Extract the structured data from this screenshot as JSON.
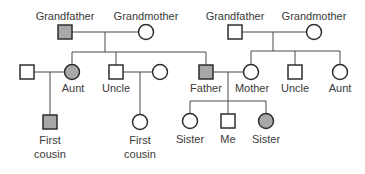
{
  "colors": {
    "line": "#4a4a4a",
    "affected_fill": "#a8a8a8",
    "unaffected_fill": "#ffffff",
    "text": "#3a3a3a"
  },
  "people": [
    {
      "id": "paternal-grandfather",
      "label": "Grandfather",
      "sex": "male",
      "affected": true,
      "cx": 65,
      "cy": 32,
      "label_y": 10
    },
    {
      "id": "paternal-grandmother",
      "label": "Grandmother",
      "sex": "female",
      "affected": false,
      "cx": 146,
      "cy": 32,
      "label_y": 10
    },
    {
      "id": "aunt-husband",
      "label": "",
      "sex": "male",
      "affected": false,
      "cx": 27,
      "cy": 72,
      "label_y": 0
    },
    {
      "id": "paternal-aunt",
      "label": "Aunt",
      "sex": "female",
      "affected": true,
      "cx": 72,
      "cy": 72,
      "label_y": 82
    },
    {
      "id": "paternal-uncle",
      "label": "Uncle",
      "sex": "male",
      "affected": false,
      "cx": 116,
      "cy": 72,
      "label_y": 82
    },
    {
      "id": "uncle-wife",
      "label": "",
      "sex": "female",
      "affected": false,
      "cx": 160,
      "cy": 72,
      "label_y": 0
    },
    {
      "id": "father",
      "label": "Father",
      "sex": "male",
      "affected": true,
      "cx": 206,
      "cy": 72,
      "label_y": 82
    },
    {
      "id": "maternal-grandfather",
      "label": "Grandfather",
      "sex": "male",
      "affected": false,
      "cx": 235,
      "cy": 32,
      "label_y": 10
    },
    {
      "id": "maternal-grandmother",
      "label": "Grandmother",
      "sex": "female",
      "affected": false,
      "cx": 314,
      "cy": 32,
      "label_y": 10
    },
    {
      "id": "mother",
      "label": "Mother",
      "sex": "female",
      "affected": false,
      "cx": 251,
      "cy": 72,
      "label_y": 82
    },
    {
      "id": "maternal-uncle",
      "label": "Uncle",
      "sex": "male",
      "affected": false,
      "cx": 295,
      "cy": 72,
      "label_y": 82
    },
    {
      "id": "maternal-aunt",
      "label": "Aunt",
      "sex": "female",
      "affected": false,
      "cx": 340,
      "cy": 72,
      "label_y": 82
    },
    {
      "id": "first-cousin-1",
      "label": "First\ncousin",
      "sex": "male",
      "affected": true,
      "cx": 50,
      "cy": 122,
      "label_y": 133
    },
    {
      "id": "first-cousin-2",
      "label": "First\ncousin",
      "sex": "female",
      "affected": false,
      "cx": 140,
      "cy": 122,
      "label_y": 133
    },
    {
      "id": "sister-1",
      "label": "Sister",
      "sex": "female",
      "affected": false,
      "cx": 190,
      "cy": 121,
      "label_y": 133
    },
    {
      "id": "me",
      "label": "Me",
      "sex": "male",
      "affected": false,
      "cx": 228,
      "cy": 121,
      "label_y": 133
    },
    {
      "id": "sister-2",
      "label": "Sister",
      "sex": "female",
      "affected": true,
      "cx": 266,
      "cy": 121,
      "label_y": 133
    }
  ],
  "lines": [
    {
      "x1": 72,
      "y1": 32,
      "x2": 139,
      "y2": 32
    },
    {
      "x1": 105,
      "y1": 32,
      "x2": 105,
      "y2": 52
    },
    {
      "x1": 72,
      "y1": 52,
      "x2": 206,
      "y2": 52
    },
    {
      "x1": 72,
      "y1": 52,
      "x2": 72,
      "y2": 65
    },
    {
      "x1": 116,
      "y1": 52,
      "x2": 116,
      "y2": 65
    },
    {
      "x1": 206,
      "y1": 52,
      "x2": 206,
      "y2": 65
    },
    {
      "x1": 34,
      "y1": 72,
      "x2": 65,
      "y2": 72
    },
    {
      "x1": 50,
      "y1": 72,
      "x2": 50,
      "y2": 115
    },
    {
      "x1": 123,
      "y1": 72,
      "x2": 153,
      "y2": 72
    },
    {
      "x1": 140,
      "y1": 72,
      "x2": 140,
      "y2": 115
    },
    {
      "x1": 242,
      "y1": 32,
      "x2": 307,
      "y2": 32
    },
    {
      "x1": 273,
      "y1": 32,
      "x2": 273,
      "y2": 51
    },
    {
      "x1": 251,
      "y1": 51,
      "x2": 340,
      "y2": 51
    },
    {
      "x1": 251,
      "y1": 51,
      "x2": 251,
      "y2": 65
    },
    {
      "x1": 295,
      "y1": 51,
      "x2": 295,
      "y2": 65
    },
    {
      "x1": 340,
      "y1": 51,
      "x2": 340,
      "y2": 65
    },
    {
      "x1": 213,
      "y1": 72,
      "x2": 244,
      "y2": 72
    },
    {
      "x1": 228,
      "y1": 72,
      "x2": 228,
      "y2": 114
    },
    {
      "x1": 190,
      "y1": 101,
      "x2": 266,
      "y2": 101
    },
    {
      "x1": 190,
      "y1": 101,
      "x2": 190,
      "y2": 114
    },
    {
      "x1": 266,
      "y1": 101,
      "x2": 266,
      "y2": 114
    }
  ],
  "labels": {
    "paternal-grandfather": "Grandfather",
    "paternal-grandmother": "Grandmother",
    "maternal-grandfather": "Grandfather",
    "maternal-grandmother": "Grandmother",
    "paternal-aunt": "Aunt",
    "paternal-uncle": "Uncle",
    "father": "Father",
    "mother": "Mother",
    "maternal-uncle": "Uncle",
    "maternal-aunt": "Aunt",
    "first-cousin-1-line1": "First",
    "first-cousin-1-line2": "cousin",
    "first-cousin-2-line1": "First",
    "first-cousin-2-line2": "cousin",
    "sister-1": "Sister",
    "me": "Me",
    "sister-2": "Sister"
  }
}
